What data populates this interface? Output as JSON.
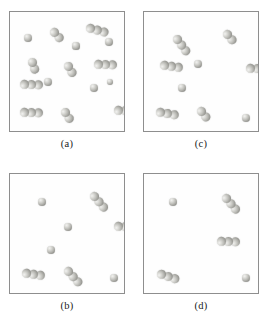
{
  "figure": {
    "type": "scientific-figure",
    "layout": "2x2-grid",
    "background_color": "#ffffff",
    "border_color": "#8e8e8e",
    "sphere_color": "#bdbdb8",
    "sphere_highlight": "#f2f2f0",
    "sphere_shadow": "#6f6f6a"
  },
  "panels": [
    {
      "id": "a",
      "caption": "(a)",
      "grid_position": "top-left",
      "cluster_count": 15,
      "sphere_count": 33,
      "clusters": [
        {
          "x": 18,
          "y": 26,
          "n": 1,
          "angle": 0,
          "r": 4.4
        },
        {
          "x": 44,
          "y": 20,
          "n": 2,
          "angle": -42,
          "r": 4.4
        },
        {
          "x": 80,
          "y": 16,
          "n": 3,
          "angle": -75,
          "r": 4.4
        },
        {
          "x": 99,
          "y": 30,
          "n": 1,
          "angle": 0,
          "r": 4.2
        },
        {
          "x": 22,
          "y": 50,
          "n": 2,
          "angle": -18,
          "r": 4.4
        },
        {
          "x": 58,
          "y": 54,
          "n": 2,
          "angle": -30,
          "r": 4.4
        },
        {
          "x": 88,
          "y": 52,
          "n": 3,
          "angle": -88,
          "r": 4.4
        },
        {
          "x": 14,
          "y": 72,
          "n": 3,
          "angle": -88,
          "r": 4.4
        },
        {
          "x": 38,
          "y": 70,
          "n": 1,
          "angle": 0,
          "r": 4.0
        },
        {
          "x": 84,
          "y": 76,
          "n": 1,
          "angle": 0,
          "r": 4.2
        },
        {
          "x": 14,
          "y": 100,
          "n": 3,
          "angle": -88,
          "r": 4.4
        },
        {
          "x": 55,
          "y": 100,
          "n": 2,
          "angle": -32,
          "r": 4.4
        },
        {
          "x": 108,
          "y": 98,
          "n": 3,
          "angle": -88,
          "r": 4.4
        },
        {
          "x": 66,
          "y": 34,
          "n": 1,
          "angle": 0,
          "r": 3.6
        },
        {
          "x": 100,
          "y": 70,
          "n": 1,
          "angle": 0,
          "r": 3.4
        }
      ]
    },
    {
      "id": "c",
      "caption": "(c)",
      "grid_position": "top-right",
      "cluster_count": 9,
      "sphere_count": 19,
      "clusters": [
        {
          "x": 33,
          "y": 27,
          "n": 3,
          "angle": -36,
          "r": 4.4
        },
        {
          "x": 83,
          "y": 22,
          "n": 2,
          "angle": -40,
          "r": 4.4
        },
        {
          "x": 20,
          "y": 53,
          "n": 3,
          "angle": -82,
          "r": 4.4
        },
        {
          "x": 54,
          "y": 52,
          "n": 1,
          "angle": 0,
          "r": 4.2
        },
        {
          "x": 106,
          "y": 56,
          "n": 3,
          "angle": -88,
          "r": 4.4
        },
        {
          "x": 38,
          "y": 76,
          "n": 1,
          "angle": 0,
          "r": 4.2
        },
        {
          "x": 16,
          "y": 100,
          "n": 3,
          "angle": -80,
          "r": 4.4
        },
        {
          "x": 57,
          "y": 99,
          "n": 2,
          "angle": -38,
          "r": 4.4
        },
        {
          "x": 102,
          "y": 106,
          "n": 1,
          "angle": 0,
          "r": 4.0
        }
      ]
    },
    {
      "id": "b",
      "caption": "(b)",
      "grid_position": "bottom-left",
      "cluster_count": 8,
      "sphere_count": 16,
      "clusters": [
        {
          "x": 32,
          "y": 28,
          "n": 1,
          "angle": 0,
          "r": 4.2
        },
        {
          "x": 84,
          "y": 22,
          "n": 3,
          "angle": -40,
          "r": 4.4
        },
        {
          "x": 58,
          "y": 53,
          "n": 1,
          "angle": 0,
          "r": 4.4
        },
        {
          "x": 108,
          "y": 52,
          "n": 3,
          "angle": -88,
          "r": 4.4
        },
        {
          "x": 41,
          "y": 76,
          "n": 1,
          "angle": 0,
          "r": 4.0
        },
        {
          "x": 16,
          "y": 99,
          "n": 3,
          "angle": -82,
          "r": 4.4
        },
        {
          "x": 58,
          "y": 97,
          "n": 3,
          "angle": -42,
          "r": 4.4
        },
        {
          "x": 104,
          "y": 104,
          "n": 1,
          "angle": 0,
          "r": 4.2
        }
      ]
    },
    {
      "id": "d",
      "caption": "(d)",
      "grid_position": "bottom-right",
      "cluster_count": 5,
      "sphere_count": 12,
      "clusters": [
        {
          "x": 29,
          "y": 28,
          "n": 1,
          "angle": 0,
          "r": 4.2
        },
        {
          "x": 82,
          "y": 24,
          "n": 3,
          "angle": -40,
          "r": 4.4
        },
        {
          "x": 77,
          "y": 67,
          "n": 3,
          "angle": -88,
          "r": 4.4
        },
        {
          "x": 17,
          "y": 100,
          "n": 3,
          "angle": -72,
          "r": 4.4
        },
        {
          "x": 102,
          "y": 104,
          "n": 1,
          "angle": 0,
          "r": 4.0
        }
      ]
    }
  ]
}
